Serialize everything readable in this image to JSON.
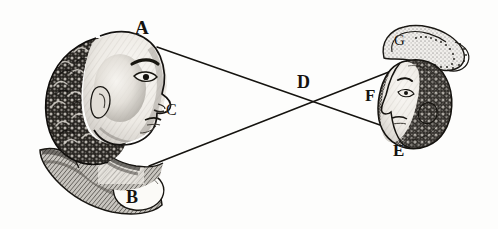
{
  "figure": {
    "background_color": "#fdfdfc",
    "ink_color": "#15130f"
  },
  "labels": {
    "A": "A",
    "B": "B",
    "C": "C",
    "D": "D",
    "E": "E",
    "F": "F",
    "G": "G"
  },
  "label_positions": {
    "A": {
      "x": 143,
      "y": 28
    },
    "B": {
      "x": 134,
      "y": 198
    },
    "C": {
      "x": 172,
      "y": 112
    },
    "D": {
      "x": 305,
      "y": 84
    },
    "E": {
      "x": 400,
      "y": 152
    },
    "F": {
      "x": 372,
      "y": 97
    },
    "G": {
      "x": 400,
      "y": 42
    }
  },
  "rays": [
    {
      "name": "ray-A-to-E",
      "from": "A",
      "to": "E",
      "x1": 157,
      "y1": 47,
      "x2": 400,
      "y2": 132
    },
    {
      "name": "ray-B-to-G",
      "from": "B",
      "to": "G",
      "x1": 149,
      "y1": 166,
      "x2": 399,
      "y2": 68
    }
  ],
  "crossing_point": {
    "name": "D",
    "x": 308,
    "y": 101
  },
  "left_head": {
    "name": "large-profile-head",
    "description": "Engraved bust of a youth in left-facing profile with dense curly hair and draped collar",
    "bounds": {
      "x": 28,
      "y": 22,
      "width": 145,
      "height": 195
    }
  },
  "right_head": {
    "name": "small-inverted-head",
    "description": "Small inverted engraved head in profile with stippled turban outline above",
    "bounds": {
      "x": 370,
      "y": 22,
      "width": 105,
      "height": 130
    }
  }
}
